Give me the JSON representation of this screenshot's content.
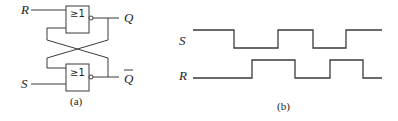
{
  "figure_a": {
    "caption": "(a)",
    "gates": [
      {
        "name": "top-nor-gate",
        "symbol": "≥1",
        "inputs": [
          "R",
          "feedback from Q̄"
        ],
        "output": "Q"
      },
      {
        "name": "bottom-nor-gate",
        "symbol": "≥1",
        "inputs": [
          "feedback from Q",
          "S"
        ],
        "output": "Q̄"
      }
    ],
    "labels": {
      "input_r": "R",
      "input_s": "S",
      "output_q": "Q",
      "output_qbar": "Q"
    }
  },
  "figure_b": {
    "caption": "(b)",
    "signals": [
      {
        "name": "S",
        "levels": [
          1,
          0,
          1,
          0,
          1
        ]
      },
      {
        "name": "R",
        "levels": [
          0,
          1,
          0,
          1,
          0
        ]
      }
    ],
    "labels": {
      "signal_s": "S",
      "signal_r": "R"
    }
  }
}
